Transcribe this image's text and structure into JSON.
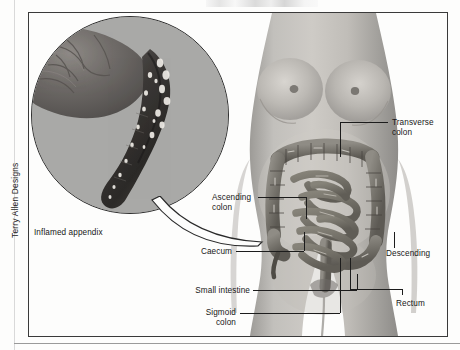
{
  "figure": {
    "credit": "Terry Allen Designs",
    "medium": "grayscale anatomical photo-illustration"
  },
  "inset": {
    "name": "magnified-appendix-circle",
    "caption": "Inflamed appendix",
    "contents": "Close-up circular magnification of caecum with an inflamed, swollen appendix"
  },
  "labels": [
    {
      "id": "transverse-colon",
      "text": "Transverse\ncolon",
      "align": "left",
      "x": 392,
      "y": 118
    },
    {
      "id": "ascending-colon",
      "text": "Ascending\ncolon",
      "align": "left",
      "x": 212,
      "y": 193
    },
    {
      "id": "caecum",
      "text": "Caecum",
      "align": "right",
      "x": 232,
      "y": 247
    },
    {
      "id": "descending",
      "text": "Descending",
      "align": "left",
      "x": 386,
      "y": 249
    },
    {
      "id": "small-intestine",
      "text": "Small intestine",
      "align": "right",
      "x": 186,
      "y": 286
    },
    {
      "id": "rectum",
      "text": "Rectum",
      "align": "left",
      "x": 396,
      "y": 299
    },
    {
      "id": "sigmoid-colon",
      "text": "Sigmoid\ncolon",
      "align": "right",
      "x": 204,
      "y": 308
    },
    {
      "id": "inflamed-appendix",
      "text": "Inflamed appendix",
      "align": "left",
      "x": 34,
      "y": 228
    }
  ],
  "colors": {
    "paper": "#fdfdfc",
    "frame_rule": "#3a3a3a",
    "label_text": "#171717",
    "leader_line": "#1c1c1c",
    "inset_background": "#a9a9a7",
    "skin_mid": "#b4b2ae",
    "colon_mid": "#7d7a74",
    "appendix_dark": "#3c3a37"
  }
}
